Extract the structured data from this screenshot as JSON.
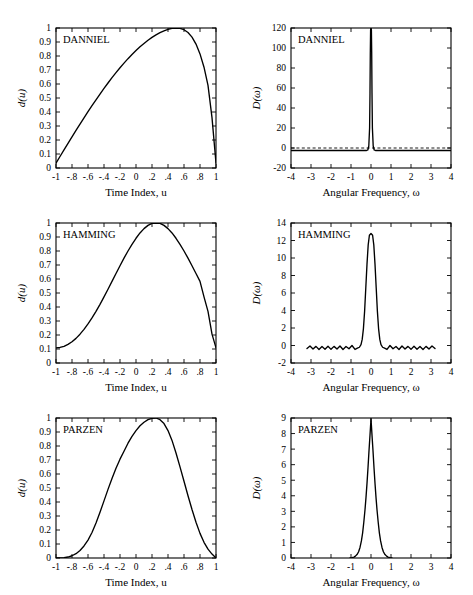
{
  "figure": {
    "name": "lag-window-figure",
    "rows": 3,
    "cols": 2,
    "background": "#ffffff",
    "ink": "#000000"
  },
  "chart_data": [
    {
      "id": "danniel-window",
      "type": "line",
      "title": "DANNIEL",
      "xlabel": "Time Index, u",
      "ylabel": "d(u)",
      "xlim": [
        -1,
        1
      ],
      "ylim": [
        0,
        1
      ],
      "grid": false,
      "legend": "none",
      "xticks": [
        -1,
        -0.8,
        -0.6,
        -0.4,
        -0.2,
        0,
        0.2,
        0.4,
        0.6,
        0.8,
        1
      ],
      "xticklabels": [
        "-1",
        "-.8",
        "-.6",
        "-.4",
        "-.2",
        "0",
        ".2",
        ".4",
        ".6",
        ".8",
        "1"
      ],
      "yticks": [
        0,
        0.1,
        0.2,
        0.3,
        0.4,
        0.5,
        0.6,
        0.7,
        0.8,
        0.9,
        1
      ],
      "yticklabels": [
        "0",
        "0.1",
        "0.2",
        "0.3",
        "0.4",
        "0.5",
        "0.6",
        "0.7",
        "0.8",
        "0.9",
        "1"
      ],
      "x": [
        -1,
        -0.95,
        -0.9,
        -0.85,
        -0.8,
        -0.75,
        -0.7,
        -0.65,
        -0.6,
        -0.55,
        -0.5,
        -0.45,
        -0.4,
        -0.35,
        -0.3,
        -0.25,
        -0.2,
        -0.15,
        -0.1,
        -0.05,
        0,
        0.05,
        0.1,
        0.15,
        0.2,
        0.25,
        0.3,
        0.35,
        0.4,
        0.45,
        0.5,
        0.55,
        0.6,
        0.65,
        0.7,
        0.75,
        0.8,
        0.85,
        0.9,
        0.95,
        1
      ],
      "values": [
        0.035,
        0.082,
        0.129,
        0.176,
        0.222,
        0.268,
        0.313,
        0.358,
        0.402,
        0.445,
        0.487,
        0.528,
        0.568,
        0.607,
        0.645,
        0.681,
        0.716,
        0.749,
        0.781,
        0.811,
        0.839,
        0.866,
        0.89,
        0.913,
        0.933,
        0.951,
        0.967,
        0.98,
        0.991,
        0.998,
        1.0,
        0.998,
        0.988,
        0.968,
        0.935,
        0.885,
        0.815,
        0.72,
        0.59,
        0.36,
        0.035
      ]
    },
    {
      "id": "danniel-spectrum",
      "type": "line",
      "title": "DANNIEL",
      "xlabel": "Angular Frequency, ω",
      "ylabel": "D(ω)",
      "xlim": [
        -4,
        4
      ],
      "ylim": [
        -20,
        120
      ],
      "grid": false,
      "legend": "none",
      "zero_reference": 0,
      "xticks": [
        -4,
        -3,
        -2,
        -1,
        0,
        1,
        2,
        3,
        4
      ],
      "xticklabels": [
        "-4",
        "-3",
        "-2",
        "-1",
        "0",
        "1",
        "2",
        "3",
        "4"
      ],
      "yticks": [
        -20,
        0,
        20,
        40,
        60,
        80,
        100,
        120
      ],
      "yticklabels": [
        "-20",
        "0",
        "20",
        "40",
        "60",
        "80",
        "100",
        "120"
      ],
      "x": [
        -4,
        -0.22,
        -0.16,
        -0.11,
        -0.07,
        -0.05,
        -0.035,
        -0.02,
        0,
        0.02,
        0.035,
        0.05,
        0.07,
        0.11,
        0.16,
        0.22,
        4
      ],
      "values": [
        -2.5,
        -2.5,
        -2,
        2,
        20,
        55,
        95,
        118,
        120,
        118,
        95,
        55,
        20,
        2,
        -2,
        -2.5,
        -2.5
      ]
    },
    {
      "id": "hamming-window",
      "type": "line",
      "title": "HAMMING",
      "xlabel": "Time Index, u",
      "ylabel": "d(u)",
      "xlim": [
        -1,
        1
      ],
      "ylim": [
        0,
        1
      ],
      "grid": false,
      "legend": "none",
      "xticks": [
        -1,
        -0.8,
        -0.6,
        -0.4,
        -0.2,
        0,
        0.2,
        0.4,
        0.6,
        0.8,
        1
      ],
      "xticklabels": [
        "-1",
        "-.8",
        "-.6",
        "-.4",
        "-.2",
        "0",
        ".2",
        ".4",
        ".6",
        ".8",
        "1"
      ],
      "yticks": [
        0,
        0.1,
        0.2,
        0.3,
        0.4,
        0.5,
        0.6,
        0.7,
        0.8,
        0.9,
        1
      ],
      "yticklabels": [
        "0",
        "0.1",
        "0.2",
        "0.3",
        "0.4",
        "0.5",
        "0.6",
        "0.7",
        "0.8",
        "0.9",
        "1"
      ],
      "x": [
        -1,
        -0.95,
        -0.9,
        -0.85,
        -0.8,
        -0.75,
        -0.7,
        -0.65,
        -0.6,
        -0.55,
        -0.5,
        -0.45,
        -0.4,
        -0.35,
        -0.3,
        -0.25,
        -0.2,
        -0.15,
        -0.1,
        -0.05,
        0,
        0.05,
        0.1,
        0.15,
        0.2,
        0.25,
        0.3,
        0.35,
        0.4,
        0.45,
        0.5,
        0.55,
        0.6,
        0.65,
        0.7,
        0.75,
        0.8,
        0.85,
        0.9,
        0.95,
        1
      ],
      "values": [
        0.108,
        0.111,
        0.119,
        0.133,
        0.152,
        0.176,
        0.206,
        0.24,
        0.279,
        0.322,
        0.369,
        0.419,
        0.472,
        0.527,
        0.583,
        0.639,
        0.695,
        0.749,
        0.8,
        0.848,
        0.891,
        0.929,
        0.96,
        0.983,
        0.998,
        1.0,
        0.998,
        0.983,
        0.96,
        0.929,
        0.891,
        0.848,
        0.8,
        0.749,
        0.695,
        0.639,
        0.583,
        0.472,
        0.369,
        0.206,
        0.108
      ]
    },
    {
      "id": "hamming-spectrum",
      "type": "line",
      "title": "HAMMING",
      "xlabel": "Angular Frequency, ω",
      "ylabel": "D(ω)",
      "xlim": [
        -4,
        4
      ],
      "ylim": [
        -2,
        14
      ],
      "grid": false,
      "legend": "none",
      "xticks": [
        -4,
        -3,
        -2,
        -1,
        0,
        1,
        2,
        3,
        4
      ],
      "xticklabels": [
        "-4",
        "-3",
        "-2",
        "-1",
        "0",
        "1",
        "2",
        "3",
        "4"
      ],
      "yticks": [
        -2,
        0,
        2,
        4,
        6,
        8,
        10,
        12,
        14
      ],
      "yticklabels": [
        "-2",
        "0",
        "2",
        "4",
        "6",
        "8",
        "10",
        "12",
        "14"
      ],
      "x": [
        -3.2,
        -3.05,
        -2.9,
        -2.75,
        -2.6,
        -2.45,
        -2.3,
        -2.15,
        -2,
        -1.85,
        -1.7,
        -1.55,
        -1.4,
        -1.25,
        -1.1,
        -0.95,
        -0.8,
        -0.68,
        -0.58,
        -0.5,
        -0.44,
        -0.38,
        -0.32,
        -0.26,
        -0.2,
        -0.14,
        -0.08,
        0,
        0.08,
        0.14,
        0.2,
        0.26,
        0.32,
        0.38,
        0.44,
        0.5,
        0.58,
        0.68,
        0.8,
        0.95,
        1.1,
        1.25,
        1.4,
        1.55,
        1.7,
        1.85,
        2,
        2.15,
        2.3,
        2.45,
        2.6,
        2.75,
        2.9,
        3.05,
        3.2
      ],
      "values": [
        -0.35,
        -0.05,
        -0.4,
        -0.1,
        -0.45,
        -0.12,
        -0.42,
        -0.08,
        -0.44,
        -0.1,
        -0.4,
        -0.05,
        -0.45,
        -0.12,
        -0.38,
        0.0,
        -0.45,
        -0.3,
        -0.2,
        0.1,
        0.7,
        1.9,
        3.9,
        6.6,
        9.3,
        11.5,
        12.6,
        12.8,
        12.6,
        11.5,
        9.3,
        6.6,
        3.9,
        1.9,
        0.7,
        0.1,
        -0.2,
        -0.3,
        -0.45,
        0.0,
        -0.38,
        -0.12,
        -0.45,
        -0.05,
        -0.4,
        -0.1,
        -0.44,
        -0.08,
        -0.42,
        -0.12,
        -0.45,
        -0.1,
        -0.4,
        -0.05,
        -0.35
      ]
    },
    {
      "id": "parzen-window",
      "type": "line",
      "title": "PARZEN",
      "xlabel": "Time Index, u",
      "ylabel": "d(u)",
      "xlim": [
        -1,
        1
      ],
      "ylim": [
        0,
        1
      ],
      "grid": false,
      "legend": "none",
      "xticks": [
        -1,
        -0.8,
        -0.6,
        -0.4,
        -0.2,
        0,
        0.2,
        0.4,
        0.6,
        0.8,
        1
      ],
      "xticklabels": [
        "-1",
        "-.8",
        "-.6",
        "-.4",
        "-.2",
        "0",
        ".2",
        ".4",
        ".6",
        ".8",
        "1"
      ],
      "yticks": [
        0,
        0.1,
        0.2,
        0.3,
        0.4,
        0.5,
        0.6,
        0.7,
        0.8,
        0.9,
        1
      ],
      "yticklabels": [
        "0",
        "0.1",
        "0.2",
        "0.3",
        "0.4",
        "0.5",
        "0.6",
        "0.7",
        "0.8",
        "0.9",
        "1"
      ],
      "x": [
        -1,
        -0.95,
        -0.9,
        -0.85,
        -0.8,
        -0.75,
        -0.7,
        -0.65,
        -0.6,
        -0.55,
        -0.5,
        -0.45,
        -0.4,
        -0.35,
        -0.3,
        -0.25,
        -0.2,
        -0.15,
        -0.1,
        -0.05,
        0,
        0.05,
        0.1,
        0.15,
        0.2,
        0.25,
        0.3,
        0.35,
        0.4,
        0.45,
        0.5,
        0.55,
        0.6,
        0.65,
        0.7,
        0.75,
        0.8,
        0.85,
        0.9,
        0.95,
        1
      ],
      "values": [
        0.0,
        0.0003,
        0.002,
        0.007,
        0.016,
        0.031,
        0.054,
        0.086,
        0.128,
        0.182,
        0.25,
        0.327,
        0.408,
        0.49,
        0.568,
        0.641,
        0.706,
        0.763,
        0.82,
        0.869,
        0.91,
        0.945,
        0.97,
        0.988,
        0.998,
        1.0,
        0.988,
        0.96,
        0.91,
        0.84,
        0.75,
        0.651,
        0.548,
        0.445,
        0.346,
        0.255,
        0.176,
        0.112,
        0.063,
        0.028,
        0.0
      ]
    },
    {
      "id": "parzen-spectrum",
      "type": "line",
      "title": "PARZEN",
      "xlabel": "Angular Frequency, ω",
      "ylabel": "D(ω)",
      "xlim": [
        -4,
        4
      ],
      "ylim": [
        0,
        9
      ],
      "grid": false,
      "legend": "none",
      "xticks": [
        -4,
        -3,
        -2,
        -1,
        0,
        1,
        2,
        3,
        4
      ],
      "xticklabels": [
        "-4",
        "-3",
        "-2",
        "-1",
        "0",
        "1",
        "2",
        "3",
        "4"
      ],
      "yticks": [
        0,
        1,
        2,
        3,
        4,
        5,
        6,
        7,
        8,
        9
      ],
      "yticklabels": [
        "0",
        "1",
        "2",
        "3",
        "4",
        "5",
        "6",
        "7",
        "8",
        "9"
      ],
      "x": [
        -1.05,
        -0.95,
        -0.85,
        -0.78,
        -0.7,
        -0.62,
        -0.55,
        -0.48,
        -0.42,
        -0.36,
        -0.3,
        -0.25,
        -0.2,
        -0.15,
        -0.1,
        -0.05,
        0,
        0.05,
        0.1,
        0.15,
        0.2,
        0.25,
        0.3,
        0.36,
        0.42,
        0.48,
        0.55,
        0.62,
        0.7,
        0.78,
        0.85,
        0.95,
        1.05
      ],
      "values": [
        0.0,
        0.02,
        0.06,
        0.12,
        0.22,
        0.4,
        0.68,
        1.1,
        1.6,
        2.3,
        3.1,
        3.9,
        4.8,
        5.8,
        6.9,
        7.9,
        8.95,
        7.9,
        6.9,
        5.8,
        4.8,
        3.9,
        3.1,
        2.3,
        1.6,
        1.1,
        0.68,
        0.4,
        0.22,
        0.12,
        0.06,
        0.02,
        0.0
      ]
    }
  ]
}
